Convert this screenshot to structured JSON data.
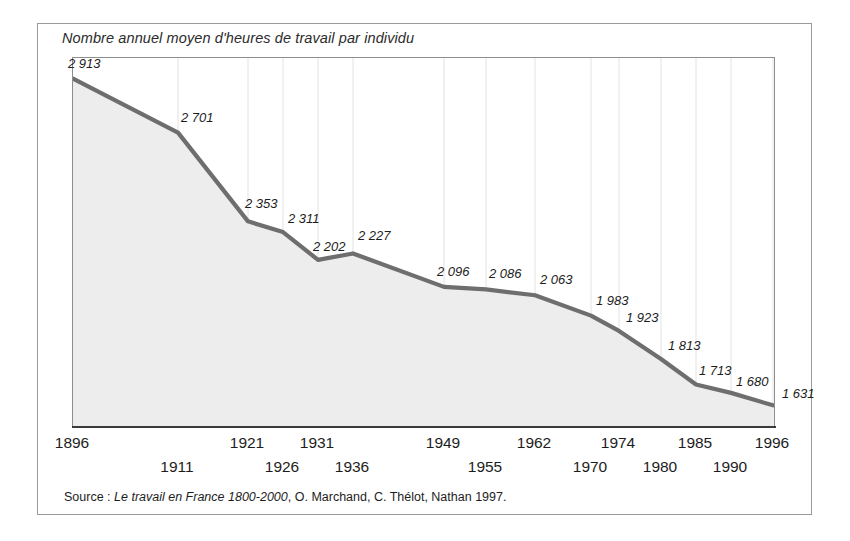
{
  "chart_data": {
    "type": "line",
    "title": "Nombre annuel moyen d'heures de travail par individu",
    "xlabel": "",
    "ylabel": "",
    "grid": true,
    "legend": "none",
    "fill_under_curve": true,
    "xlim": [
      1896,
      1996
    ],
    "ylim": [
      1550,
      2990
    ],
    "categories": [
      "1896",
      "1911",
      "1921",
      "1926",
      "1931",
      "1936",
      "1949",
      "1955",
      "1962",
      "1970",
      "1974",
      "1980",
      "1985",
      "1990",
      "1996"
    ],
    "x": [
      1896,
      1911,
      1921,
      1926,
      1931,
      1936,
      1949,
      1955,
      1962,
      1970,
      1974,
      1980,
      1985,
      1990,
      1996
    ],
    "values": [
      2913,
      2701,
      2353,
      2311,
      2202,
      2227,
      2096,
      2086,
      2063,
      1983,
      1923,
      1813,
      1713,
      1680,
      1631
    ],
    "point_labels": [
      "2 913",
      "2 701",
      "2 353",
      "2 311",
      "2 202",
      "2 227",
      "2 096",
      "2 086",
      "2 063",
      "1 983",
      "1 923",
      "1 813",
      "1 713",
      "1 680",
      "1 631"
    ],
    "tick_labels_top_row": [
      "1896",
      "1921",
      "1931",
      "1949",
      "1962",
      "1974",
      "1985",
      "1996"
    ],
    "tick_labels_bottom_row": [
      "1911",
      "1926",
      "1936",
      "1955",
      "1970",
      "1980",
      "1990"
    ],
    "colors": {
      "line": "#6e6e6e",
      "fill": "#ededed",
      "grid": "#e2e2e2",
      "axis": "#3a3a3a",
      "frame": "#9a9a9a",
      "text": "#1d1d1d",
      "background": "#ffffff"
    }
  },
  "source": {
    "prefix": "Source : ",
    "title": "Le travail en France 1800-2000",
    "rest": ", O. Marchand, C. Thélot, Nathan 1997."
  }
}
